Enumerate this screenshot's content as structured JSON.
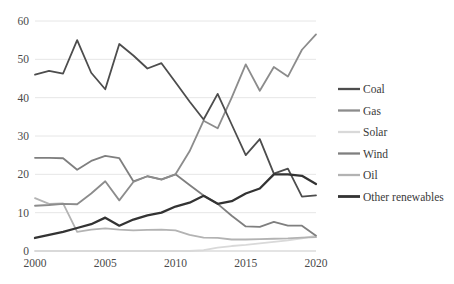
{
  "chart_data": {
    "type": "line",
    "title": "",
    "subtitle": "",
    "xlabel": "",
    "ylabel": "",
    "xlim": [
      2000,
      2020
    ],
    "ylim": [
      0,
      60
    ],
    "grid": true,
    "legend_position": "right",
    "x": [
      2000,
      2001,
      2002,
      2003,
      2004,
      2005,
      2006,
      2007,
      2008,
      2009,
      2010,
      2011,
      2012,
      2013,
      2014,
      2015,
      2016,
      2017,
      2018,
      2019,
      2020
    ],
    "xticks": [
      "2000",
      "2005",
      "2010",
      "2015",
      "2020"
    ],
    "xtick_values": [
      2000,
      2005,
      2010,
      2015,
      2020
    ],
    "yticks": [
      "0",
      "10",
      "20",
      "30",
      "40",
      "50",
      "60"
    ],
    "ytick_values": [
      0,
      10,
      20,
      30,
      40,
      50,
      60
    ],
    "series": [
      {
        "name": "Coal",
        "color": "#4d4d4d",
        "width": 1.8,
        "values": [
          46.0,
          47.0,
          46.3,
          55.0,
          46.5,
          42.2,
          54.0,
          51.0,
          47.6,
          49.0,
          44.0,
          39.0,
          34.3,
          41.0,
          33.0,
          25.0,
          29.2,
          20.2,
          21.5,
          14.2,
          14.5
        ]
      },
      {
        "name": "Gas",
        "color": "#8c8c8c",
        "width": 1.8,
        "values": [
          11.8,
          12.0,
          12.3,
          12.2,
          15.0,
          18.2,
          13.2,
          18.0,
          19.5,
          18.6,
          20.0,
          26.0,
          34.0,
          32.0,
          40.0,
          48.7,
          41.8,
          48.0,
          45.5,
          52.5,
          56.5
        ]
      },
      {
        "name": "Solar",
        "color": "#d9d9d9",
        "width": 1.8,
        "values": [
          0.0,
          0.0,
          0.0,
          0.0,
          0.0,
          0.0,
          0.0,
          0.0,
          0.0,
          0.0,
          0.0,
          0.0,
          0.2,
          0.9,
          1.3,
          1.6,
          2.0,
          2.4,
          2.8,
          3.3,
          4.0
        ]
      },
      {
        "name": "Wind",
        "color": "#7f7f7f",
        "width": 1.8,
        "values": [
          24.3,
          24.3,
          24.2,
          21.2,
          23.5,
          24.8,
          24.2,
          18.2,
          19.5,
          18.7,
          20.0,
          17.2,
          14.5,
          12.3,
          9.2,
          6.4,
          6.3,
          7.6,
          6.6,
          6.6,
          4.0
        ]
      },
      {
        "name": "Oil",
        "color": "#b3b3b3",
        "width": 1.8,
        "values": [
          13.8,
          12.3,
          12.4,
          5.0,
          5.6,
          5.9,
          5.6,
          5.4,
          5.5,
          5.6,
          5.4,
          4.2,
          3.5,
          3.4,
          3.0,
          3.0,
          3.1,
          3.2,
          3.3,
          3.5,
          3.6
        ]
      },
      {
        "name": "Other renewables",
        "color": "#333333",
        "width": 2.3,
        "values": [
          3.4,
          4.2,
          5.0,
          6.0,
          7.0,
          8.7,
          6.6,
          8.2,
          9.3,
          10.0,
          11.6,
          12.6,
          14.4,
          12.3,
          13.0,
          15.0,
          16.3,
          20.0,
          20.0,
          19.6,
          17.5
        ]
      }
    ]
  },
  "legend": {
    "items": [
      {
        "label": "Coal"
      },
      {
        "label": "Gas"
      },
      {
        "label": "Solar"
      },
      {
        "label": "Wind"
      },
      {
        "label": "Oil"
      },
      {
        "label": "Other renewables"
      }
    ]
  }
}
